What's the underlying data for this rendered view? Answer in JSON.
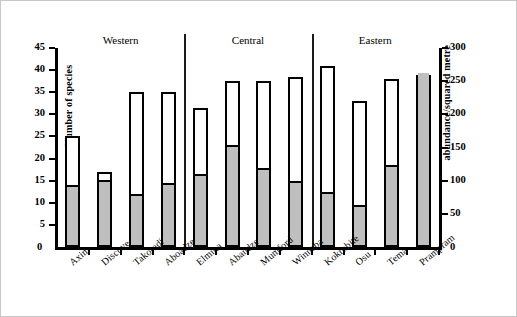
{
  "chart_data": {
    "type": "bar",
    "title": "",
    "xlabel": "",
    "ylabel": "Number of species",
    "y2label": "abundance/squared metre",
    "ylim": [
      0,
      45
    ],
    "y2lim": [
      0,
      300
    ],
    "yticks": [
      0,
      5,
      10,
      15,
      20,
      25,
      30,
      35,
      40,
      45
    ],
    "y2ticks": [
      0,
      50,
      100,
      150,
      200,
      250,
      300
    ],
    "grid": false,
    "legend": "none",
    "categories": [
      "Axim",
      "Discove",
      "Takoradi",
      "Aboadze",
      "Elmina",
      "Abandze",
      "Mumford",
      "Winneba",
      "Kokrobite",
      "Osu",
      "Tema",
      "Prampram"
    ],
    "series": [
      {
        "name": "Number of species",
        "axis": "left",
        "style": "open",
        "values": [
          25,
          17,
          35,
          35,
          31.5,
          37.5,
          37.5,
          38.5,
          41,
          33,
          38,
          39
        ]
      },
      {
        "name": "abundance/squared metre",
        "axis": "right",
        "style": "filled-grey",
        "values_left_scale": [
          13.5,
          14.7,
          11.5,
          14,
          16,
          22.5,
          17.5,
          14.5,
          12,
          9,
          18,
          39
        ],
        "values": [
          90,
          98,
          77,
          93,
          107,
          150,
          117,
          97,
          80,
          60,
          120,
          260
        ]
      }
    ],
    "groups": [
      {
        "label": "Western",
        "categories": [
          "Axim",
          "Discove",
          "Takoradi",
          "Aboadze"
        ]
      },
      {
        "label": "Central",
        "categories": [
          "Elmina",
          "Abandze",
          "Mumford",
          "Winneba"
        ]
      },
      {
        "label": "Eastern",
        "categories": [
          "Kokrobite",
          "Osu",
          "Tema",
          "Prampram"
        ]
      }
    ],
    "colors": {
      "open_bar_fill": "#ffffff",
      "bar_outline": "#000000",
      "grey_fill": "#bfbfbf"
    }
  }
}
